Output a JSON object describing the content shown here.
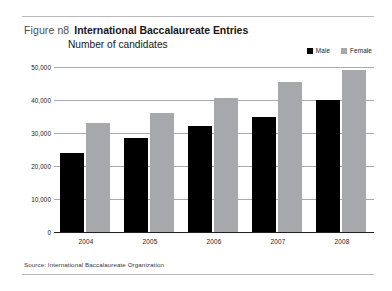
{
  "figure": {
    "label": "Figure n8",
    "title": "International Baccalaureate Entries",
    "subtitle": "Number of candidates",
    "source": "Source: International Baccalaureate Organization"
  },
  "legend": {
    "items": [
      {
        "label": "Male",
        "color": "#000000"
      },
      {
        "label": "Female",
        "color": "#a6a8ab"
      }
    ]
  },
  "axis": {
    "y_ticks": [
      "0",
      "10,000",
      "20,000",
      "30,000",
      "40,000",
      "50,000"
    ],
    "x_ticks": [
      "2004",
      "2005",
      "2006",
      "2007",
      "2008"
    ]
  },
  "chart_data": {
    "type": "bar",
    "title": "International Baccalaureate Entries",
    "subtitle": "Number of candidates",
    "xlabel": "",
    "ylabel": "Number of candidates",
    "ylim": [
      0,
      50000
    ],
    "ytick_values": [
      0,
      10000,
      20000,
      30000,
      40000,
      50000
    ],
    "grid": true,
    "legend_position": "top-right",
    "categories": [
      "2004",
      "2005",
      "2006",
      "2007",
      "2008"
    ],
    "series": [
      {
        "name": "Male",
        "color": "#000000",
        "values": [
          24000,
          28500,
          32000,
          35000,
          40000
        ]
      },
      {
        "name": "Female",
        "color": "#a6a8ab",
        "values": [
          33000,
          36000,
          40500,
          45500,
          49000
        ]
      }
    ],
    "source": "Source: International Baccalaureate Organization"
  }
}
